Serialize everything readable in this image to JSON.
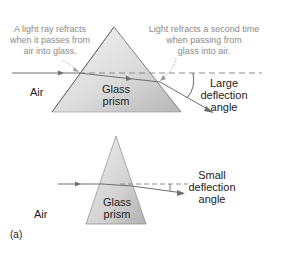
{
  "figure": {
    "panel_label": "(a)",
    "top": {
      "medium_label": "Air",
      "prism_label_line1": "Glass",
      "prism_label_line2": "prism",
      "note_left": [
        "A light ray refracts",
        "when it passes from",
        "air into glass."
      ],
      "note_right": [
        "Light refracts a second time",
        "when passing from",
        "glass into air."
      ],
      "angle_label": [
        "Large",
        "deflection",
        "angle"
      ]
    },
    "bottom": {
      "medium_label": "Air",
      "prism_label_line1": "Glass",
      "prism_label_line2": "prism",
      "angle_label": [
        "Small",
        "deflection",
        "angle"
      ]
    },
    "colors": {
      "ray": "#6e6e6e",
      "dashed": "#8c8c8c",
      "prism_light": "#f2f2f2",
      "prism_dark": "#b8b8b8",
      "prism_edge": "#555555",
      "note_text": "#8a8a8a"
    }
  }
}
